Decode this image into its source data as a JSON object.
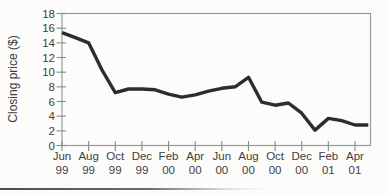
{
  "chart_data": {
    "type": "line",
    "title": "",
    "xlabel": "",
    "ylabel": "Closing price ($)",
    "ylim": [
      0,
      18
    ],
    "yticks": [
      0,
      2,
      4,
      6,
      8,
      10,
      12,
      14,
      16,
      18
    ],
    "grid": false,
    "legend": false,
    "line_color": "#2d2d2d",
    "frame_color": "#9b9b9b",
    "tick_color": "#8a8a8a",
    "xtick_labels": [
      {
        "month": "Jun",
        "year": "99"
      },
      {
        "month": "Aug",
        "year": "99"
      },
      {
        "month": "Oct",
        "year": "99"
      },
      {
        "month": "Dec",
        "year": "99"
      },
      {
        "month": "Feb",
        "year": "00"
      },
      {
        "month": "Apr",
        "year": "00"
      },
      {
        "month": "Jun",
        "year": "00"
      },
      {
        "month": "Aug",
        "year": "00"
      },
      {
        "month": "Oct",
        "year": "00"
      },
      {
        "month": "Dec",
        "year": "00"
      },
      {
        "month": "Feb",
        "year": "01"
      },
      {
        "month": "Apr",
        "year": "01"
      }
    ],
    "series": [
      {
        "name": "Closing price ($)",
        "x": [
          "Jun 99",
          "Jul 99",
          "Aug 99",
          "Sep 99",
          "Oct 99",
          "Nov 99",
          "Dec 99",
          "Jan 00",
          "Feb 00",
          "Mar 00",
          "Apr 00",
          "May 00",
          "Jun 00",
          "Jul 00",
          "Aug 00",
          "Sep 00",
          "Oct 00",
          "Nov 00",
          "Dec 00",
          "Jan 01",
          "Feb 01",
          "Mar 01",
          "Apr 01",
          "May 01"
        ],
        "values": [
          15.4,
          14.7,
          14.0,
          10.3,
          7.2,
          7.7,
          7.7,
          7.6,
          7.0,
          6.6,
          6.9,
          7.4,
          7.8,
          8.0,
          9.3,
          5.9,
          5.5,
          5.8,
          4.4,
          2.1,
          3.7,
          3.4,
          2.8,
          2.8
        ]
      }
    ]
  }
}
